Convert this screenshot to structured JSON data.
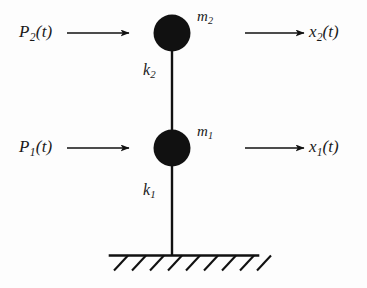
{
  "figure": {
    "type": "mechanics-schematic",
    "background_color": "#fdfdfd",
    "ink_color": "#111111",
    "width": 367,
    "height": 288
  },
  "labels": {
    "force_upper": {
      "symbol": "P",
      "subscript": "2",
      "argument": "(t)",
      "text": "P2(t)"
    },
    "force_lower": {
      "symbol": "P",
      "subscript": "1",
      "argument": "(t)",
      "text": "P1(t)"
    },
    "mass_upper": {
      "symbol": "m",
      "subscript": "2",
      "text": "m2"
    },
    "mass_lower": {
      "symbol": "m",
      "subscript": "1",
      "text": "m1"
    },
    "stiffness_upper": {
      "symbol": "k",
      "subscript": "2",
      "text": "k2"
    },
    "stiffness_lower": {
      "symbol": "k",
      "subscript": "1",
      "text": "k1"
    },
    "displacement_upper": {
      "symbol": "x",
      "subscript": "2",
      "argument": "(t)",
      "text": "x2(t)"
    },
    "displacement_lower": {
      "symbol": "x",
      "subscript": "1",
      "argument": "(t)",
      "text": "x1(t)"
    }
  },
  "geometry": {
    "masses": [
      {
        "name": "mass-2",
        "cx": 172,
        "cy": 33,
        "r": 18.5,
        "fill": "#111111"
      },
      {
        "name": "mass-1",
        "cx": 172,
        "cy": 148,
        "r": 18.5,
        "fill": "#111111"
      }
    ],
    "column": {
      "x": 172,
      "y_top": 33,
      "y_bottom": 256,
      "width": 2.4
    },
    "ground": {
      "y": 255.5,
      "x_start": 110,
      "x_end": 258,
      "hatch_count": 9,
      "hatch_spacing": 18,
      "hatch_dx": -14,
      "hatch_dy": 15
    },
    "force_arrows": [
      {
        "name": "arrow-force-2",
        "x1": 67,
        "y1": 33,
        "x2": 129,
        "y2": 33
      },
      {
        "name": "arrow-force-1",
        "x1": 67,
        "y1": 148,
        "x2": 129,
        "y2": 148
      }
    ],
    "displacement_arrows": [
      {
        "name": "arrow-displacement-2",
        "x1": 245,
        "y1": 33,
        "x2": 304,
        "y2": 33
      },
      {
        "name": "arrow-displacement-1",
        "x1": 245,
        "y1": 148,
        "x2": 304,
        "y2": 148
      }
    ]
  }
}
